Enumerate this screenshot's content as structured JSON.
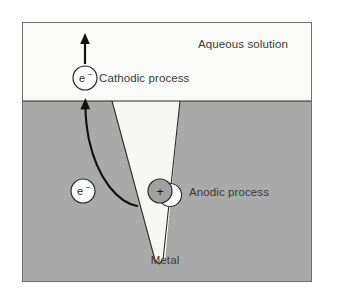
{
  "figure": {
    "frame": {
      "x": 22,
      "y": 22,
      "width": 290,
      "height": 260,
      "border_color": "#6f6f6f",
      "background": "#fbfbfa"
    },
    "regions": [
      {
        "id": "aqueous-solution",
        "label": "Aqueous solution",
        "color": "#fafaf8",
        "label_x": 243,
        "label_y": 48
      },
      {
        "id": "metal",
        "label": "Metal",
        "color": "#a9a9a9",
        "label_x": 165,
        "label_y": 263
      },
      {
        "id": "pit-cavity",
        "label": "",
        "color": "#f6f6f3"
      }
    ],
    "processes": [
      {
        "id": "cathodic",
        "label": "Cathodic process",
        "label_x": 100,
        "label_y": 82,
        "carrier": "e−",
        "carrier_symbol": "e",
        "carrier_charge": "−",
        "circle_x": 85,
        "circle_y": 78,
        "circle_r": 12,
        "circle_fill": "#ffffff",
        "circle_stroke": "#2b2b2b"
      },
      {
        "id": "anodic",
        "label": "Anodic process",
        "label_x": 190,
        "label_y": 196,
        "carrier": "+",
        "carrier_symbol": "+",
        "carrier_charge": "",
        "circle_x": 160,
        "circle_y": 191,
        "circle_r": 12,
        "circle_fill": "#a0a0a0",
        "circle_stroke": "#2b2b2b"
      },
      {
        "id": "bulk-electron",
        "label": "",
        "carrier": "e−",
        "carrier_symbol": "e",
        "carrier_charge": "−",
        "circle_x": 83,
        "circle_y": 191,
        "circle_r": 12,
        "circle_fill": "#ffffff",
        "circle_stroke": "#2b2b2b"
      }
    ],
    "arrows": [
      {
        "id": "cathodic-release-arrow",
        "kind": "straight",
        "from_x": 85,
        "from_y": 64,
        "to_x": 85,
        "to_y": 36,
        "color": "#111111"
      },
      {
        "id": "electron-migration-arrow",
        "kind": "curved",
        "from_x": 137,
        "from_y": 206,
        "to_x": 85,
        "to_y": 100,
        "color": "#111111"
      }
    ],
    "colors": {
      "metal": "#a9a9a9",
      "solution": "#fafaf8",
      "pit": "#f6f6f3",
      "outline": "#2b2b2b",
      "frame": "#6f6f6f",
      "text": "#3a3a3a",
      "page": "#ffffff"
    }
  }
}
